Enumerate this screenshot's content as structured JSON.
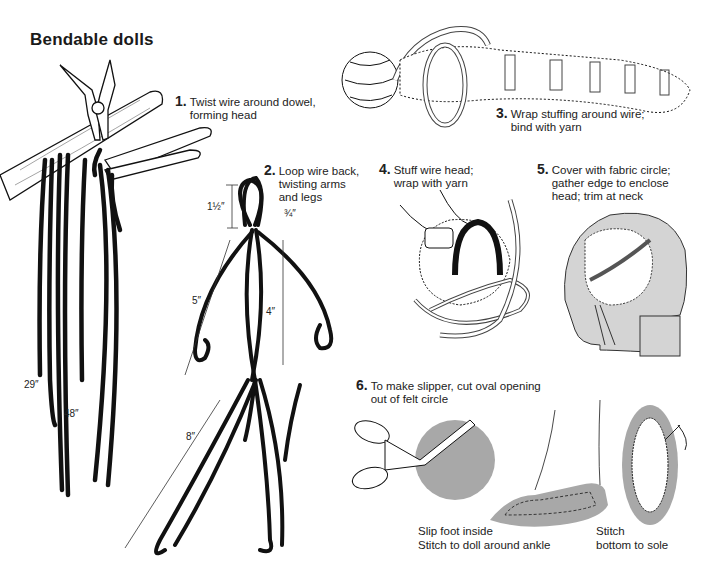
{
  "title": "Bendable dolls",
  "steps": [
    {
      "num": "1.",
      "lines": [
        "Twist wire around dowel,",
        "forming head"
      ]
    },
    {
      "num": "2.",
      "lines": [
        "Loop wire back,",
        "twisting arms",
        "and legs"
      ]
    },
    {
      "num": "3.",
      "lines": [
        "Wrap stuffing around wire;",
        "bind with yarn"
      ]
    },
    {
      "num": "4.",
      "lines": [
        "Stuff wire head;",
        "wrap with yarn"
      ]
    },
    {
      "num": "5.",
      "lines": [
        "Cover with fabric circle;",
        "gather edge to enclose",
        "head; trim at neck"
      ]
    },
    {
      "num": "6.",
      "lines": [
        "To make slipper, cut oval opening",
        "out of felt circle"
      ]
    }
  ],
  "measurements": {
    "wire_short": "29″",
    "wire_long": "48″",
    "head": "1½″",
    "neck": "¾″",
    "arm": "5″",
    "torso": "4″",
    "leg": "8″"
  },
  "captions": {
    "slipper_foot": [
      "Slip foot inside",
      "Stitch to doll around ankle"
    ],
    "slipper_sole": [
      "Stitch",
      "bottom to sole"
    ]
  },
  "colors": {
    "ink": "#111111",
    "felt_gray": "#a8a8a8",
    "fabric_gray": "#d4d4d4",
    "background": "#ffffff"
  }
}
